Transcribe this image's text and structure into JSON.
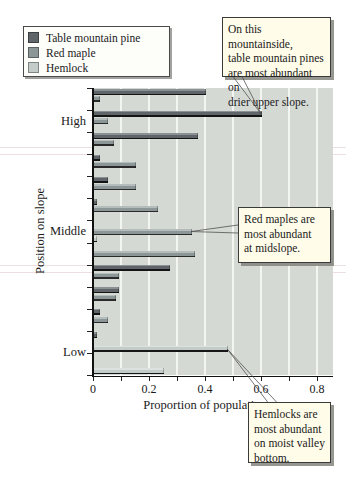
{
  "legend": {
    "items": [
      {
        "label": "Table mountain pine",
        "color": "#5f6569"
      },
      {
        "label": "Red maple",
        "color": "#8d9697"
      },
      {
        "label": "Hemlock",
        "color": "#c4ccca"
      }
    ]
  },
  "callouts": [
    {
      "text": "On this mountainside,\ntable mountain pines\nare most abundant on\ndrier upper slope.",
      "target_series": "Table mountain pine",
      "target_group": 2
    },
    {
      "text": "Red maples are\nmost abundant\nat midslope.",
      "target_series": "Red maple",
      "target_group": 7
    },
    {
      "text": "Hemlocks are\nmost abundant\non moist valley\nbottom.",
      "target_series": "Hemlock",
      "target_group": 12
    }
  ],
  "chart_data": {
    "type": "bar",
    "orientation": "horizontal",
    "xlabel": "Proportion of population",
    "ylabel": "Position on slope",
    "xlim": [
      0,
      0.8
    ],
    "x_tick_labels": [
      "0",
      "0.2",
      "0.4",
      "0.6",
      "0.8"
    ],
    "x_major_tick_step": 0.2,
    "x_minor_tick_step": 0.1,
    "grid": "vertical gridlines every 0.1, white on gray panel",
    "legend_position": "top-left",
    "slope_positions": 13,
    "position_labels": [
      {
        "label": "High",
        "group_center": 1.5
      },
      {
        "label": "Middle",
        "group_center": 6.5
      },
      {
        "label": "Low",
        "group_center": 12.0
      }
    ],
    "series": [
      {
        "name": "Table mountain pine",
        "color": "#5f6569",
        "highlight": "#8a9094",
        "shadow": "#141414",
        "values": [
          0.4,
          0.6,
          0.37,
          0.02,
          0.05,
          0.01,
          0,
          0,
          0.27,
          0.09,
          0.02,
          0.01,
          0
        ]
      },
      {
        "name": "Red maple",
        "color": "#8d9697",
        "highlight": "#b4bcbc",
        "shadow": "#2a2a2a",
        "values": [
          0.02,
          0.05,
          0.07,
          0.15,
          0.15,
          0.23,
          0.35,
          0.36,
          0.09,
          0.08,
          0.05,
          0,
          0
        ]
      },
      {
        "name": "Hemlock",
        "color": "#c4ccca",
        "highlight": "#dde2e0",
        "shadow": "#161616",
        "values": [
          0,
          0,
          0,
          0,
          0,
          0,
          0.01,
          0,
          0,
          0,
          0,
          0.48,
          0.25
        ]
      }
    ]
  }
}
